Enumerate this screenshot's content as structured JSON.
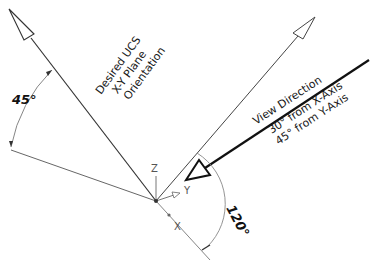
{
  "diagram": {
    "ucs_label": [
      "Desired UCS",
      "X-Y Plane",
      "Orientation"
    ],
    "view_label": {
      "title": "View Direction",
      "line1": "30° from X-Axis",
      "line2": "45° from Y-Axis"
    },
    "angles": {
      "left": "45°",
      "right": "120°"
    },
    "axes": {
      "z": "Z",
      "y": "Y",
      "x": "X"
    },
    "colors": {
      "line": "#333333",
      "thick_line": "#111111",
      "thin_line": "#777777"
    }
  }
}
